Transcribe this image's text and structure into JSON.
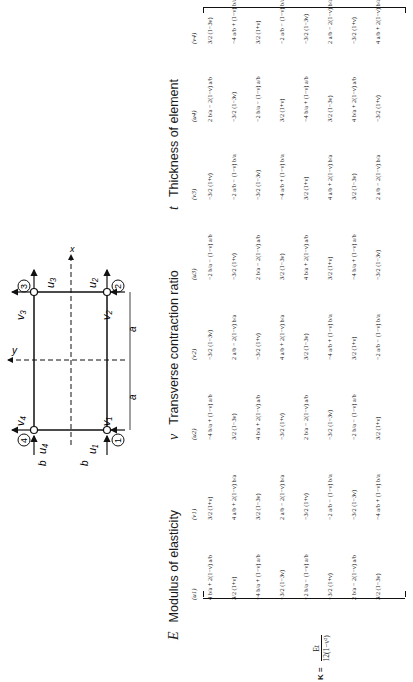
{
  "legend": {
    "E": {
      "symbol": "E",
      "text": "Modulus of elasticity"
    },
    "nu": {
      "symbol": "ν",
      "text": "Transverse contraction ratio"
    },
    "t": {
      "symbol": "t",
      "text": "Thickness of element"
    }
  },
  "diagram": {
    "nodes": [
      "1",
      "2",
      "3",
      "4"
    ],
    "axis_x": "x",
    "axis_y": "y",
    "dim_a": "a",
    "dim_b": "b",
    "dofs": {
      "u1": "u1",
      "v1": "v1",
      "u2": "u2",
      "v2": "v2",
      "u3": "u3",
      "v3": "v3",
      "u4": "u4",
      "v4": "v4"
    }
  },
  "matrix": {
    "prefix": "K =",
    "factor_num": "Et",
    "factor_den": "12(1−ν²)",
    "headers": [
      "(u1)",
      "(v1)",
      "(u2)",
      "(v2)",
      "(u3)",
      "(v3)",
      "(u4)",
      "(v4)"
    ],
    "columns": [
      [
        "4 b/a + 2(1−ν) a/b",
        "3/2 (1+ν)",
        "−4 b/a + (1−ν) a/b",
        "−3/2 (1−3ν)",
        "−2 b/a − (1−ν) a/b",
        "−3/2 (1+ν)",
        "2 b/a − 2(1−ν) a/b",
        "3/2 (1−3ν)"
      ],
      [
        "3/2 (1+ν)",
        "4 a/b + 2(1−ν) b/a",
        "3/2 (1−3ν)",
        "2 a/b − 2(1−ν) b/a",
        "−3/2 (1+ν)",
        "−2 a/b − (1−ν) b/a",
        "−3/2 (1−3ν)",
        "−4 a/b + (1−ν) b/a"
      ],
      [
        "−4 b/a + (1−ν) a/b",
        "3/2 (1−3ν)",
        "4 b/a + 2(1−ν) a/b",
        "−3/2 (1+ν)",
        "2 b/a − 2(1−ν) a/b",
        "−3/2 (1−3ν)",
        "−2 b/a − (1−ν) a/b",
        "3/2 (1+ν)"
      ],
      [
        "−3/2 (1−3ν)",
        "2 a/b − 2(1−ν) b/a",
        "−3/2 (1+ν)",
        "4 a/b + 2(1−ν) b/a",
        "3/2 (1−3ν)",
        "−4 a/b + (1−ν) b/a",
        "3/2 (1+ν)",
        "−2 a/b − (1−ν) b/a"
      ],
      [
        "−2 b/a − (1−ν) a/b",
        "−3/2 (1+ν)",
        "2 b/a − 2(1−ν) a/b",
        "3/2 (1−3ν)",
        "4 b/a + 2(1−ν) a/b",
        "3/2 (1+ν)",
        "−4 b/a + (1−ν) a/b",
        "−3/2 (1−3ν)"
      ],
      [
        "−3/2 (1+ν)",
        "−2 a/b − (1−ν) b/a",
        "−3/2 (1−3ν)",
        "−4 a/b + (1−ν) b/a",
        "3/2 (1+ν)",
        "4 a/b + 2(1−ν) b/a",
        "3/2 (1−3ν)",
        "2 a/b − 2(1−ν) b/a"
      ],
      [
        "2 b/a − 2(1−ν) a/b",
        "−3/2 (1−3ν)",
        "−2 b/a − (1−ν) a/b",
        "3/2 (1+ν)",
        "−4 b/a + (1−ν) a/b",
        "3/2 (1−3ν)",
        "4 b/a + 2(1−ν) a/b",
        "−3/2 (1+ν)"
      ],
      [
        "3/2 (1−3ν)",
        "−4 a/b + (1−ν) b/a",
        "3/2 (1+ν)",
        "−2 a/b − (1−ν) b/a",
        "−3/2 (1−3ν)",
        "2 a/b − 2(1−ν) b/a",
        "−3/2 (1+ν)",
        "4 a/b + 2(1−ν) b/a"
      ]
    ]
  }
}
